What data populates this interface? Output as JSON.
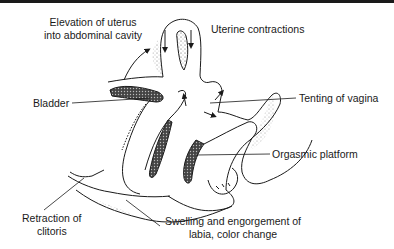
{
  "diagram": {
    "type": "anatomical-illustration",
    "labels": {
      "elevation_line1": "Elevation of uterus",
      "elevation_line2": "into abdominal cavity",
      "uterine_contractions": "Uterine contractions",
      "bladder": "Bladder",
      "tenting": "Tenting of vagina",
      "orgasmic_platform": "Orgasmic platform",
      "retraction_line1": "Retraction of",
      "retraction_line2": "clitoris",
      "swelling_line1": "Swelling and engorgement of",
      "swelling_line2": "labia, color change"
    },
    "colors": {
      "ink": "#1a1a1a",
      "background": "#ffffff"
    }
  }
}
